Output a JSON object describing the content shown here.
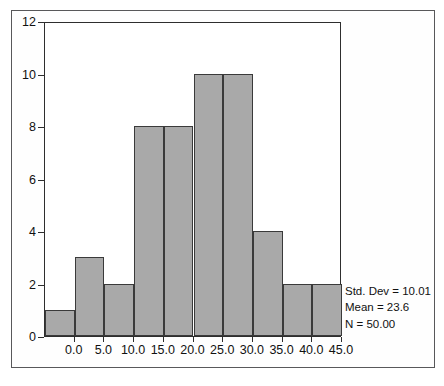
{
  "chart_data": {
    "type": "bar",
    "title": "",
    "xlabel": "",
    "ylabel": "",
    "categories": [
      "0.0",
      "5.0",
      "10.0",
      "15.0",
      "20.0",
      "25.0",
      "30.0",
      "35.0",
      "40.0",
      "45.0"
    ],
    "bin_centers": [
      -2.5,
      2.5,
      7.5,
      12.5,
      17.5,
      22.5,
      27.5,
      32.5,
      37.5,
      42.5
    ],
    "values": [
      1,
      3,
      2,
      8,
      8,
      10,
      10,
      4,
      2,
      2
    ],
    "xlim": [
      -5.0,
      45.0
    ],
    "ylim": [
      0,
      12
    ],
    "x_ticks": [
      "0.0",
      "5.0",
      "10.0",
      "15.0",
      "20.0",
      "25.0",
      "30.0",
      "35.0",
      "40.0",
      "45.0"
    ],
    "y_ticks": [
      "0",
      "2",
      "4",
      "6",
      "8",
      "10",
      "12"
    ],
    "grid": false,
    "legend": "none",
    "bar_color": "#a9a9a9",
    "bar_edge_color": "#3a3a3a",
    "axis_color": "#2e2e2e",
    "annotations": [
      "Std. Dev = 10.01",
      "Mean = 23.6",
      "N = 50.00"
    ]
  },
  "stats": {
    "std_dev": "Std. Dev = 10.01",
    "mean": "Mean = 23.6",
    "n": "N = 50.00"
  }
}
